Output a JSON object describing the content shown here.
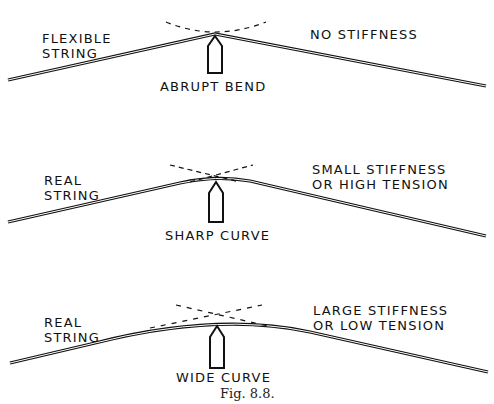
{
  "figure": {
    "caption": "Fig. 8.8.",
    "panels": [
      {
        "left_label_1": "FLEXIBLE",
        "left_label_2": "STRING",
        "right_label_1": "NO STIFFNESS",
        "right_label_2": "",
        "bridge_label": "ABRUPT BEND",
        "shape": "sharp-kink"
      },
      {
        "left_label_1": "REAL",
        "left_label_2": "STRING",
        "right_label_1": "SMALL STIFFNESS",
        "right_label_2": "OR HIGH TENSION",
        "bridge_label": "SHARP CURVE",
        "shape": "small-radius-curve"
      },
      {
        "left_label_1": "REAL",
        "left_label_2": "STRING",
        "right_label_1": "LARGE STIFFNESS",
        "right_label_2": "OR LOW TENSION",
        "bridge_label": "WIDE CURVE",
        "shape": "large-radius-curve"
      }
    ],
    "colors": {
      "ink": "#111111",
      "background": "#ffffff"
    }
  }
}
